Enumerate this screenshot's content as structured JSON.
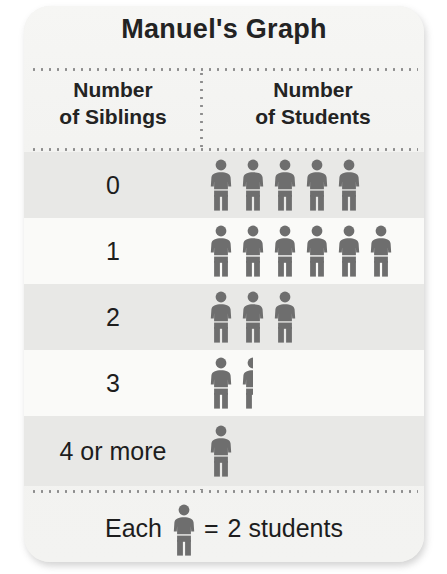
{
  "title": "Manuel's Graph",
  "headers": {
    "left_line1": "Number",
    "left_line2": "of Siblings",
    "right_line1": "Number",
    "right_line2": "of Students"
  },
  "legend": {
    "prefix": "Each",
    "equals": "=",
    "suffix": "2 students"
  },
  "colors": {
    "figure": "#6e6e6e",
    "text": "#1d1d1d",
    "card_background": "#f2f2f0",
    "row_band": "#e8e8e6",
    "row_plain": "#fafaf8",
    "dotted_rule": "#8d8d8d"
  },
  "chart_data": {
    "type": "pictogram",
    "title": "Manuel's Graph",
    "xlabel": "Number of Siblings",
    "ylabel": "Number of Students",
    "symbol": "person",
    "symbol_value": 2,
    "legend_text": "Each = 2 students",
    "categories": [
      "0",
      "1",
      "2",
      "3",
      "4 or more"
    ],
    "symbol_counts": [
      5,
      6,
      3,
      1.5,
      1
    ],
    "values": [
      10,
      12,
      6,
      3,
      2
    ],
    "rows": [
      {
        "label": "0",
        "full": 5,
        "half": 0,
        "symbols": 5,
        "students": 10
      },
      {
        "label": "1",
        "full": 6,
        "half": 0,
        "symbols": 6,
        "students": 12
      },
      {
        "label": "2",
        "full": 3,
        "half": 0,
        "symbols": 3,
        "students": 6
      },
      {
        "label": "3",
        "full": 1,
        "half": 1,
        "symbols": 1.5,
        "students": 3
      },
      {
        "label": "4 or more",
        "full": 1,
        "half": 0,
        "symbols": 1,
        "students": 2
      }
    ],
    "grid": false,
    "legend_position": "bottom"
  }
}
